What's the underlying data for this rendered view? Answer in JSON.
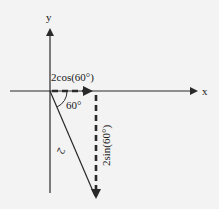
{
  "diagram": {
    "type": "vector-decomposition",
    "background": "#f3f3f3",
    "line_color": "#2a2a2a",
    "axes": {
      "x_label": "x",
      "y_label": "y"
    },
    "vector": {
      "magnitude_label": "2",
      "angle_label": "60°"
    },
    "components": {
      "horizontal_label": "2cos(60°)",
      "vertical_label": "2sin(60°)"
    }
  }
}
